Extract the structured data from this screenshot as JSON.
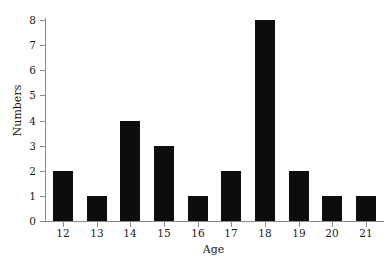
{
  "chart_data": {
    "type": "bar",
    "title": "",
    "subtitle": "",
    "xlabel": "Age",
    "ylabel": "Numbers",
    "categories": [
      "12",
      "13",
      "14",
      "15",
      "16",
      "17",
      "18",
      "19",
      "20",
      "21"
    ],
    "values": [
      2,
      1,
      4,
      3,
      1,
      2,
      8,
      2,
      1,
      1
    ],
    "y_ticks": [
      "0",
      "1",
      "2",
      "3",
      "4",
      "5",
      "6",
      "7",
      "8"
    ],
    "ylim": [
      0,
      8
    ],
    "grid": false,
    "legend": null,
    "legend_position": "none",
    "annotations": [],
    "bar_color": "#0d0d0d",
    "axis_color": "#8a8a8a",
    "background_color": "#ffffff"
  }
}
